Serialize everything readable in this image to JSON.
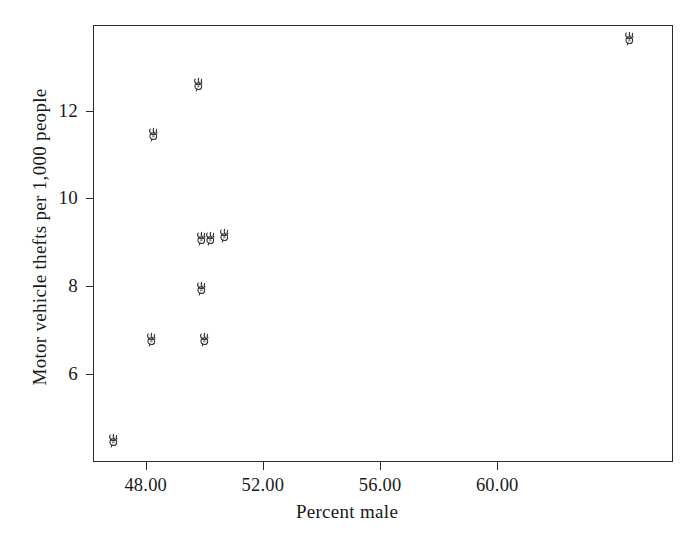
{
  "chart_data": {
    "type": "scatter",
    "title": "",
    "xlabel": "Percent male",
    "ylabel": "Motor vehicle thefts per 1,000 people",
    "xlim": [
      46.2,
      66.0
    ],
    "ylim": [
      4.0,
      13.95
    ],
    "grid": false,
    "legend": null,
    "marker": "car-glyph-marker",
    "marker_color": "#333333",
    "xticks": [
      48.0,
      52.0,
      56.0,
      60.0
    ],
    "xticklabels": [
      "48.00",
      "52.00",
      "56.00",
      "60.00"
    ],
    "yticks": [
      6,
      8,
      10,
      12
    ],
    "yticklabels": [
      "6",
      "8",
      "10",
      "12"
    ],
    "points": [
      {
        "x": 46.9,
        "y": 4.5
      },
      {
        "x": 48.2,
        "y": 6.8
      },
      {
        "x": 50.0,
        "y": 6.8
      },
      {
        "x": 49.9,
        "y": 7.95
      },
      {
        "x": 49.9,
        "y": 9.1
      },
      {
        "x": 50.2,
        "y": 9.1
      },
      {
        "x": 50.7,
        "y": 9.15
      },
      {
        "x": 48.25,
        "y": 11.45
      },
      {
        "x": 49.8,
        "y": 12.6
      },
      {
        "x": 64.5,
        "y": 13.65
      }
    ]
  },
  "axes": {
    "frame_color": "#2b2b2b",
    "background": "#ffffff"
  }
}
